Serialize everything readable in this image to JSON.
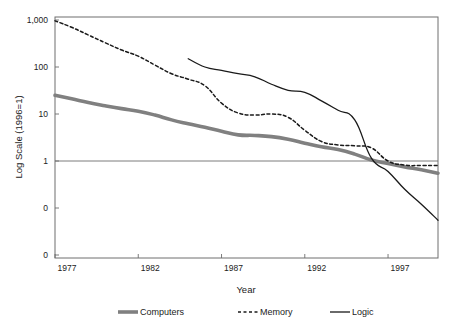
{
  "chart_data": {
    "type": "line",
    "title": "",
    "xlabel": "Year",
    "ylabel": "Log Scale (1996=1)",
    "scale": "log",
    "grid": "single-horizontal-at-1",
    "legend_position": "bottom",
    "xlim": [
      1977,
      2000
    ],
    "ylim": [
      0.01,
      1000
    ],
    "x_ticks": [
      "1977",
      "1982",
      "1987",
      "1992",
      "1997"
    ],
    "x_tick_values": [
      1977,
      1982,
      1987,
      1992,
      1997
    ],
    "y_ticks": [
      "1,000",
      "100",
      "10",
      "1",
      "0",
      "0"
    ],
    "y_tick_values": [
      1000,
      100,
      10,
      1,
      0.1,
      0.01
    ],
    "series": [
      {
        "name": "Computers",
        "style": "thick-solid-gray",
        "color": "#808080",
        "width": 3.6,
        "x": [
          1977,
          1978,
          1979,
          1980,
          1981,
          1982,
          1983,
          1984,
          1985,
          1986,
          1987,
          1988,
          1989,
          1990,
          1991,
          1992,
          1993,
          1994,
          1995,
          1996,
          1997,
          1998,
          1999,
          2000
        ],
        "values": [
          25,
          21,
          17.5,
          15,
          13,
          11.5,
          9.5,
          7.5,
          6.2,
          5.2,
          4.3,
          3.6,
          3.5,
          3.3,
          2.9,
          2.4,
          2.0,
          1.75,
          1.4,
          1.05,
          0.88,
          0.75,
          0.65,
          0.55
        ]
      },
      {
        "name": "Memory",
        "style": "dashed-black",
        "color": "#1a1a1a",
        "width": 1.5,
        "dash": "3,2.5",
        "x": [
          1977,
          1978,
          1979,
          1980,
          1981,
          1982,
          1983,
          1984,
          1985,
          1986,
          1987,
          1988,
          1989,
          1990,
          1991,
          1992,
          1993,
          1994,
          1995,
          1996,
          1997,
          1998,
          1999,
          2000
        ],
        "values": [
          960,
          700,
          480,
          330,
          230,
          170,
          110,
          72,
          55,
          40,
          17,
          10.5,
          9.5,
          10,
          8.5,
          4.5,
          2.6,
          2.2,
          2.1,
          1.9,
          1.0,
          0.82,
          0.8,
          0.8
        ]
      },
      {
        "name": "Logic",
        "style": "thin-solid-black",
        "color": "#1a1a1a",
        "width": 1.3,
        "x": [
          1985,
          1986,
          1987,
          1988,
          1989,
          1990,
          1991,
          1992,
          1993,
          1994,
          1995,
          1996,
          1997,
          1998,
          1999,
          2000
        ],
        "values": [
          150,
          100,
          85,
          72,
          62,
          43,
          32,
          29,
          19,
          12,
          7.5,
          1.15,
          0.6,
          0.25,
          0.12,
          0.055
        ]
      }
    ]
  },
  "axes": {
    "y_title": "Log Scale (1996=1)",
    "x_title": "Year"
  },
  "legend": {
    "items": [
      {
        "label": "Computers",
        "swatch": "thick-gray-line"
      },
      {
        "label": "Memory",
        "swatch": "dashed-black-line"
      },
      {
        "label": "Logic",
        "swatch": "thin-black-line"
      }
    ]
  },
  "geometry": {
    "plot_left": 55,
    "plot_right": 438,
    "plot_top": 17,
    "plot_bottom": 258,
    "decade_px": 47,
    "y_for_1000": 20,
    "year_px": 16.65
  }
}
